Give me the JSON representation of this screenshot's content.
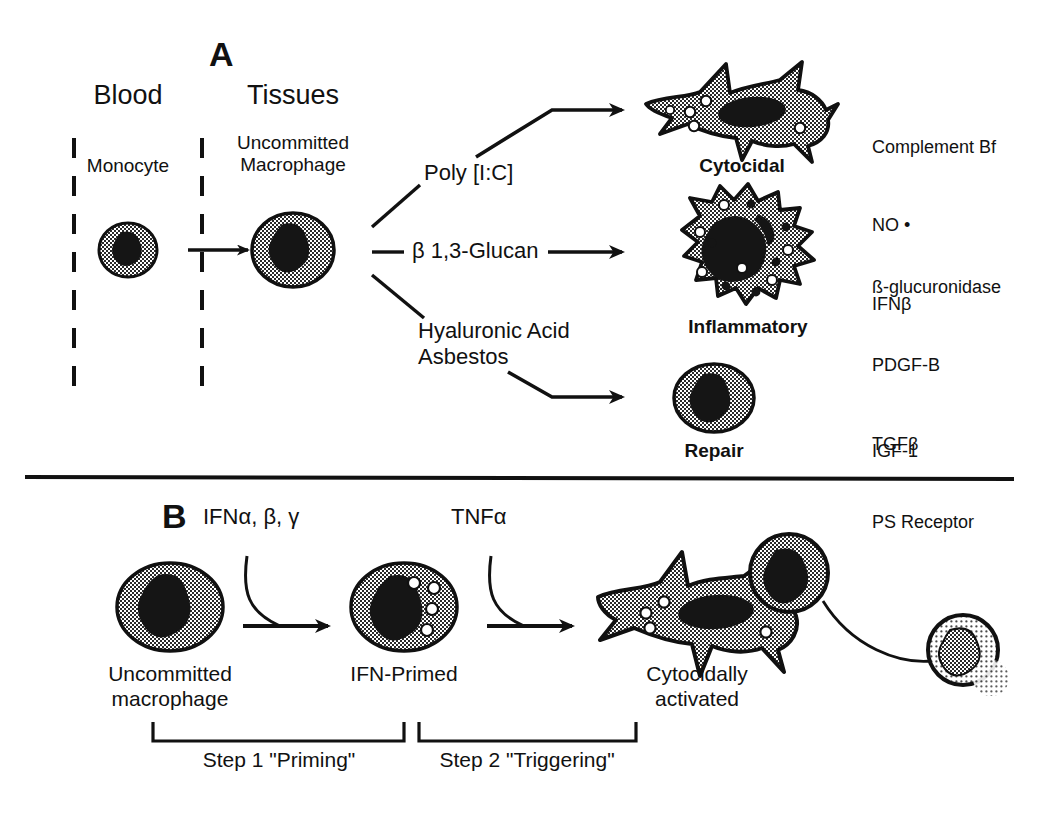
{
  "figure": {
    "type": "scientific-diagram",
    "title_a_letter": "A",
    "title_b_letter": "B"
  },
  "panel_a": {
    "letter": "A",
    "compartments": [
      {
        "name": "blood-header",
        "label": "Blood"
      },
      {
        "name": "tissues-header",
        "label": "Tissues"
      }
    ],
    "cells_left": [
      {
        "name": "monocyte",
        "label": "Monocyte",
        "shape": "round"
      },
      {
        "name": "uncommitted-macrophage",
        "label": "Uncommitted\nMacrophage",
        "shape": "oval"
      }
    ],
    "stimuli": [
      {
        "name": "poly-ic",
        "label": "Poly [I:C]"
      },
      {
        "name": "beta-glucan",
        "label": "β 1,3-Glucan"
      },
      {
        "name": "hyaluronic-asbestos",
        "label": "Hyaluronic Acid\nAsbestos"
      }
    ],
    "outcomes": [
      {
        "name": "cytocidal",
        "label": "Cytocidal",
        "shape": "stellate",
        "products": [
          "Complement Bf",
          "NO •",
          "IFNβ"
        ]
      },
      {
        "name": "inflammatory",
        "label": "Inflammatory",
        "shape": "ruffled",
        "products": [
          "ß-glucuronidase",
          "PDGF-B",
          "TGFβ",
          "PS Receptor"
        ]
      },
      {
        "name": "repair",
        "label": "Repair",
        "shape": "round",
        "products": [
          "IGF-1"
        ]
      }
    ]
  },
  "panel_b": {
    "letter": "B",
    "signals": [
      {
        "name": "ifn-signal",
        "label": "IFNα, β, γ"
      },
      {
        "name": "tnf-signal",
        "label": "TNFα"
      }
    ],
    "states": [
      {
        "name": "uncommitted-macrophage",
        "label": "Uncommitted\nmacrophage"
      },
      {
        "name": "ifn-primed",
        "label": "IFN-Primed"
      },
      {
        "name": "cytocidally-activated",
        "label": "Cytocidally\nactivated"
      }
    ],
    "steps": [
      {
        "name": "step-1",
        "label": "Step 1 \"Priming\""
      },
      {
        "name": "step-2",
        "label": "Step 2 \"Triggering\""
      }
    ]
  },
  "colors": {
    "ink": "#111111",
    "cell_fill_gray": "#8a8a8a",
    "nucleus": "#151515",
    "background": "#ffffff"
  }
}
